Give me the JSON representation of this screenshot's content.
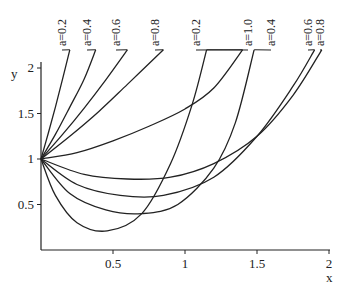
{
  "chart_data": {
    "type": "line",
    "title": "",
    "xlabel": "x",
    "ylabel": "y",
    "xlim": [
      0,
      2
    ],
    "ylim": [
      0,
      2.2
    ],
    "grid": false,
    "legend": "inline labels at top of curves",
    "x_ticks": [
      "0.5",
      "1",
      "1.5",
      "2"
    ],
    "y_ticks": [
      "0.5",
      "1",
      "1.5",
      "2"
    ],
    "series": [
      {
        "name": "a=0.2",
        "group": "upper",
        "points": [
          [
            0,
            1
          ],
          [
            0.05,
            1.28
          ],
          [
            0.1,
            1.57
          ],
          [
            0.15,
            1.88
          ],
          [
            0.2,
            2.2
          ]
        ]
      },
      {
        "name": "a=0.4",
        "group": "upper",
        "points": [
          [
            0,
            1
          ],
          [
            0.1,
            1.27
          ],
          [
            0.2,
            1.57
          ],
          [
            0.3,
            1.88
          ],
          [
            0.38,
            2.2
          ]
        ]
      },
      {
        "name": "a=0.6",
        "group": "upper",
        "points": [
          [
            0,
            1
          ],
          [
            0.15,
            1.27
          ],
          [
            0.3,
            1.56
          ],
          [
            0.45,
            1.87
          ],
          [
            0.6,
            2.2
          ]
        ]
      },
      {
        "name": "a=0.8",
        "group": "upper",
        "points": [
          [
            0,
            1
          ],
          [
            0.2,
            1.25
          ],
          [
            0.4,
            1.52
          ],
          [
            0.6,
            1.82
          ],
          [
            0.85,
            2.2
          ]
        ]
      },
      {
        "name": "a=1.0",
        "group": "upper",
        "points": [
          [
            0,
            1
          ],
          [
            0.25,
            1.07
          ],
          [
            0.5,
            1.2
          ],
          [
            0.75,
            1.36
          ],
          [
            1.0,
            1.55
          ],
          [
            1.2,
            1.78
          ],
          [
            1.4,
            2.2
          ]
        ]
      },
      {
        "name": "a=0.2",
        "group": "lower",
        "points": [
          [
            0,
            1
          ],
          [
            0.1,
            0.6
          ],
          [
            0.25,
            0.3
          ],
          [
            0.46,
            0.21
          ],
          [
            0.7,
            0.4
          ],
          [
            0.9,
            0.95
          ],
          [
            1.05,
            1.6
          ],
          [
            1.15,
            2.2
          ]
        ]
      },
      {
        "name": "a=0.4",
        "group": "lower",
        "points": [
          [
            0,
            1
          ],
          [
            0.2,
            0.62
          ],
          [
            0.45,
            0.44
          ],
          [
            0.7,
            0.4
          ],
          [
            0.95,
            0.5
          ],
          [
            1.2,
            0.9
          ],
          [
            1.35,
            1.4
          ],
          [
            1.48,
            2.2
          ]
        ]
      },
      {
        "name": "a=0.6",
        "group": "lower",
        "points": [
          [
            0,
            1
          ],
          [
            0.25,
            0.72
          ],
          [
            0.55,
            0.6
          ],
          [
            0.85,
            0.6
          ],
          [
            1.2,
            0.8
          ],
          [
            1.5,
            1.25
          ],
          [
            1.75,
            1.8
          ],
          [
            1.9,
            2.2
          ]
        ]
      },
      {
        "name": "a=0.8",
        "group": "lower",
        "points": [
          [
            0,
            1
          ],
          [
            0.3,
            0.83
          ],
          [
            0.6,
            0.78
          ],
          [
            0.9,
            0.8
          ],
          [
            1.2,
            0.95
          ],
          [
            1.5,
            1.25
          ],
          [
            1.75,
            1.7
          ],
          [
            1.95,
            2.2
          ]
        ]
      }
    ],
    "labels": [
      {
        "text": "a=0.2",
        "x_px": 62
      },
      {
        "text": "a=0.4",
        "x_px": 87
      },
      {
        "text": "a=0.6",
        "x_px": 116
      },
      {
        "text": "a=0.8",
        "x_px": 155
      },
      {
        "text": "a=0.2",
        "x_px": 196
      },
      {
        "text": "a=1.0",
        "x_px": 248
      },
      {
        "text": "a=0.4",
        "x_px": 271
      },
      {
        "text": "a=0.6",
        "x_px": 308
      },
      {
        "text": "a=0.8",
        "x_px": 320
      }
    ]
  }
}
